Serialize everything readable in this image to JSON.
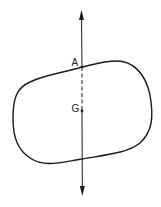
{
  "figure": {
    "type": "physics-diagram",
    "colors": {
      "stroke": "#1a1a1a",
      "background": "#ffffff"
    },
    "labels": {
      "point_a": "A",
      "point_g": "G"
    },
    "line": {
      "style_upper": "solid",
      "style_inside_A_to_G": "dashed",
      "style_lower": "solid",
      "arrowheads": [
        "top",
        "bottom"
      ]
    }
  }
}
